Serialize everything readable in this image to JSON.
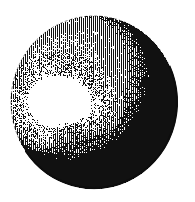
{
  "figure": {
    "title": "Engraved spherical object with specular highlight",
    "caption": "",
    "style": "vintage line-engraving / woodcut",
    "medium": "black ink vertical hatching on white ground",
    "background_color": "#ffffff",
    "ink_color": "#111111",
    "canvas": {
      "width": 195,
      "height": 202
    },
    "sphere": {
      "name": "sphere-body",
      "center_x": 94,
      "center_y": 102,
      "radius_x": 83,
      "radius_y": 86,
      "bounds": {
        "left": 11,
        "top": 16,
        "right": 177,
        "bottom": 188
      },
      "fill_tone": "#3a3a3a",
      "rim": {
        "name": "dark-rim-band",
        "color": "#0d0d0d",
        "thickness": 12,
        "arc_start_deg": -25,
        "arc_end_deg": 145,
        "description": "solid dark band along lower-right and bottom edge"
      },
      "hatching": {
        "direction": "vertical",
        "line_spacing": 2,
        "line_width": 1,
        "seed": 1987
      }
    },
    "highlight": {
      "name": "specular-highlight",
      "color": "#ffffff",
      "center_x": 58,
      "center_y": 101,
      "radius_x": 31,
      "radius_y": 22,
      "rotation_deg": -8,
      "soft_edge": 9,
      "description": "irregular rounded white blob upper-left of center"
    },
    "light": {
      "direction": "upper-left",
      "falloff": "gradual stipple transition into dense hatch"
    }
  }
}
